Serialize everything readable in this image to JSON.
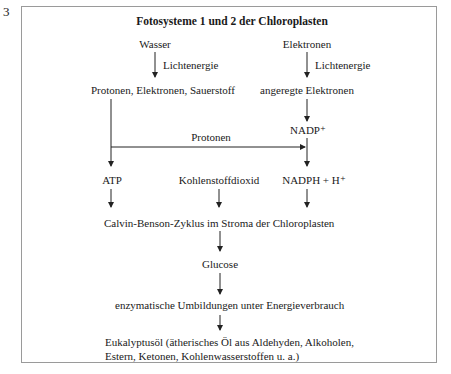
{
  "figure_number": "3",
  "diagram": {
    "title": "Fotosysteme 1 und 2 der Chloroplasten",
    "nodes": {
      "wasser": "Wasser",
      "elektronen": "Elektronen",
      "lichtenergie_left": "Lichtenergie",
      "lichtenergie_right": "Lichtenergie",
      "protonen_elektronen_sauerstoff": "Protonen, Elektronen, Sauerstoff",
      "angeregte_elektronen": "angeregte Elektronen",
      "nadp": "NADP⁺",
      "protonen_label": "Protonen",
      "atp": "ATP",
      "kohlenstoffdioxid": "Kohlenstoffdioxid",
      "nadph": "NADPH + H⁺",
      "calvin": "Calvin-Benson-Zyklus im Stroma der Chloroplasten",
      "glucose": "Glucose",
      "enzymatisch": "enzymatische Umbildungen unter Energieverbrauch",
      "eukalyptus_line1": "Eukalyptusöl (ätherisches Öl aus Aldehyden, Alkoholen,",
      "eukalyptus_line2": "Estern, Ketonen, Kohlenwasserstoffen u. a.)"
    },
    "edges": [
      {
        "from": "Wasser",
        "to": "Protonen, Elektronen, Sauerstoff",
        "label": "Lichtenergie"
      },
      {
        "from": "Elektronen",
        "to": "angeregte Elektronen",
        "label": "Lichtenergie"
      },
      {
        "from": "angeregte Elektronen",
        "to": "NADP⁺"
      },
      {
        "from": "Protonen, Elektronen, Sauerstoff",
        "to": "NADPH + H⁺",
        "label": "Protonen"
      },
      {
        "from": "Protonen, Elektronen, Sauerstoff",
        "to": "ATP"
      },
      {
        "from": "NADP⁺",
        "to": "NADPH + H⁺"
      },
      {
        "from": "ATP",
        "to": "Calvin-Benson-Zyklus im Stroma der Chloroplasten"
      },
      {
        "from": "Kohlenstoffdioxid",
        "to": "Calvin-Benson-Zyklus im Stroma der Chloroplasten"
      },
      {
        "from": "NADPH + H⁺",
        "to": "Calvin-Benson-Zyklus im Stroma der Chloroplasten"
      },
      {
        "from": "Calvin-Benson-Zyklus im Stroma der Chloroplasten",
        "to": "Glucose"
      },
      {
        "from": "Glucose",
        "to": "enzymatische Umbildungen unter Energieverbrauch"
      },
      {
        "from": "enzymatische Umbildungen unter Energieverbrauch",
        "to": "Eukalyptusöl"
      }
    ]
  }
}
